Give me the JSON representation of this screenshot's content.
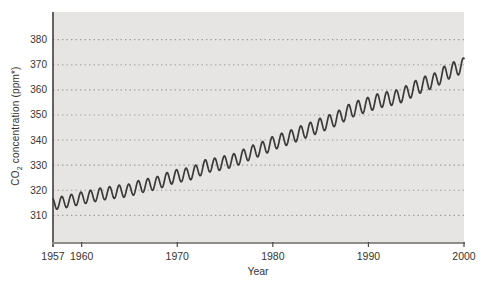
{
  "colors": {
    "page_bg": "#ffffff",
    "plot_bg": "#e6e5e3",
    "grid": "#9d9c98",
    "left_axis": "#403f3d",
    "bottom_axis": "#8e8d89",
    "tick": "#4a4947",
    "line": "#3b3a38",
    "text": "#363330"
  },
  "chart_data": {
    "type": "line",
    "title": "",
    "x_axis": {
      "label": "Year",
      "range": [
        1957,
        2000
      ],
      "tick_years": [
        1957,
        1960,
        1970,
        1980,
        1990,
        2000
      ]
    },
    "y_axis": {
      "label_prefix": "CO",
      "label_sub": "2",
      "label_suffix": " concentration (ppm*)",
      "ticks": [
        310,
        320,
        330,
        340,
        350,
        360,
        370,
        380
      ],
      "range": [
        299,
        391
      ]
    },
    "grid": "horizontal-dotted",
    "seasonal_amplitude_ppm": {
      "start": 2.4,
      "end": 3.0
    },
    "annual_trend_ppm": [
      [
        1957,
        314.6
      ],
      [
        1958,
        315.2
      ],
      [
        1959,
        316.0
      ],
      [
        1960,
        316.9
      ],
      [
        1961,
        317.6
      ],
      [
        1962,
        318.5
      ],
      [
        1963,
        319.0
      ],
      [
        1964,
        319.6
      ],
      [
        1965,
        320.0
      ],
      [
        1966,
        321.4
      ],
      [
        1967,
        322.2
      ],
      [
        1968,
        323.0
      ],
      [
        1969,
        324.6
      ],
      [
        1970,
        325.7
      ],
      [
        1971,
        326.3
      ],
      [
        1972,
        327.5
      ],
      [
        1973,
        329.7
      ],
      [
        1974,
        330.2
      ],
      [
        1975,
        331.1
      ],
      [
        1976,
        332.0
      ],
      [
        1977,
        333.8
      ],
      [
        1978,
        335.4
      ],
      [
        1979,
        336.8
      ],
      [
        1980,
        338.7
      ],
      [
        1981,
        340.1
      ],
      [
        1982,
        341.4
      ],
      [
        1983,
        343.0
      ],
      [
        1984,
        344.4
      ],
      [
        1985,
        346.0
      ],
      [
        1986,
        347.4
      ],
      [
        1987,
        349.2
      ],
      [
        1988,
        351.5
      ],
      [
        1989,
        353.0
      ],
      [
        1990,
        354.2
      ],
      [
        1991,
        355.6
      ],
      [
        1992,
        356.4
      ],
      [
        1993,
        357.1
      ],
      [
        1994,
        358.8
      ],
      [
        1995,
        360.9
      ],
      [
        1996,
        362.6
      ],
      [
        1997,
        363.8
      ],
      [
        1998,
        366.6
      ],
      [
        1999,
        368.3
      ],
      [
        2000,
        369.8
      ]
    ]
  }
}
